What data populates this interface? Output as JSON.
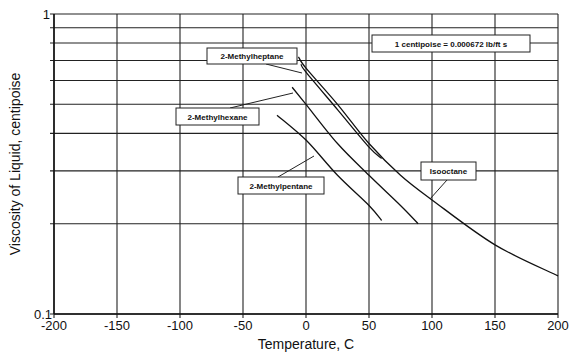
{
  "chart_data": {
    "type": "line",
    "title": "",
    "xlabel": "Temperature, C",
    "ylabel": "Viscosity of Liquid, centipoise",
    "xlim": [
      -200,
      200
    ],
    "ylim": [
      0.1,
      1
    ],
    "yscale": "log",
    "grid": true,
    "x_ticks": [
      "-200",
      "-150",
      "-100",
      "-50",
      "0",
      "50",
      "100",
      "150",
      "200"
    ],
    "y_ticks": [
      "0.1",
      "1"
    ],
    "annotation": "1 centipoise = 0.000672 lb/ft s",
    "series": [
      {
        "name": "Isooctane",
        "x": [
          -6,
          0,
          25,
          50,
          75,
          100,
          150,
          200
        ],
        "y": [
          0.72,
          0.66,
          0.5,
          0.37,
          0.29,
          0.24,
          0.17,
          0.134
        ]
      },
      {
        "name": "2-Methylheptane",
        "x": [
          -4,
          0,
          25,
          50,
          60
        ],
        "y": [
          0.68,
          0.64,
          0.48,
          0.36,
          0.33
        ]
      },
      {
        "name": "2-Methylhexane",
        "x": [
          -11,
          0,
          25,
          50,
          75,
          89
        ],
        "y": [
          0.57,
          0.5,
          0.37,
          0.29,
          0.23,
          0.2
        ]
      },
      {
        "name": "2-Methylpentane",
        "x": [
          -23,
          0,
          25,
          50,
          60
        ],
        "y": [
          0.46,
          0.38,
          0.29,
          0.23,
          0.205
        ]
      }
    ]
  },
  "labels": {
    "x_ticks": [
      "-200",
      "-150",
      "-100",
      "-50",
      "0",
      "50",
      "100",
      "150",
      "200"
    ],
    "y_top": "1",
    "y_bottom": "0.1",
    "xlabel": "Temperature, C",
    "ylabel": "Viscosity of Liquid, centipoise",
    "conversion": "1 centipoise = 0.000672 lb/ft s",
    "methylheptane": "2-Methylheptane",
    "methylhexane": "2-Methylhexane",
    "methylpentane": "2-Methylpentane",
    "isooctane": "Isooctane"
  }
}
